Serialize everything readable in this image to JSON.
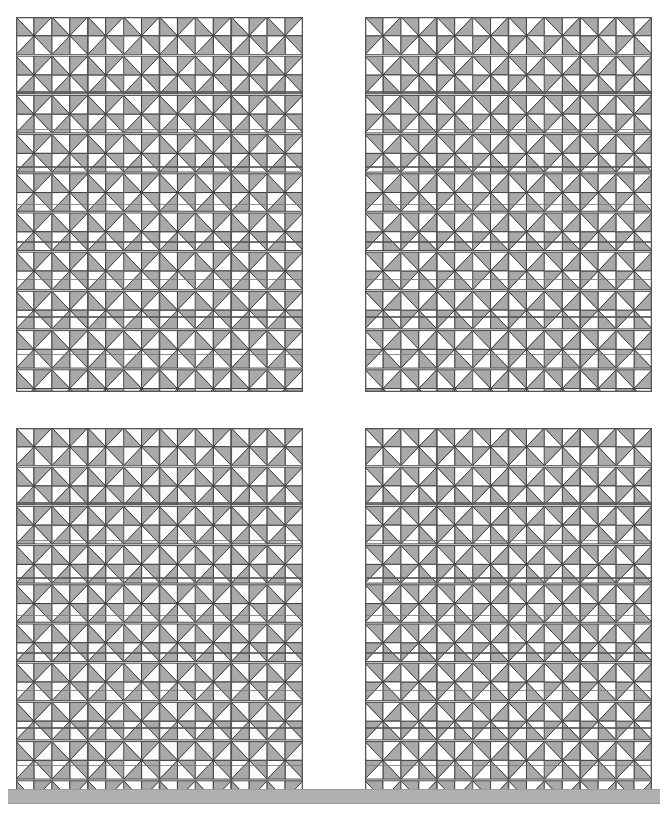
{
  "figure": {
    "title": "",
    "caption": "",
    "width": 668,
    "height": 816,
    "background": "#ffffff"
  },
  "palette": {
    "gray_fill": "#a9a9a9",
    "white_fill": "#ffffff",
    "light_fill": "#f4f4f4",
    "pale_fill": "#fbfbfb",
    "stroke": "#3a3a3a",
    "grid_major": "#555555",
    "grid_minor": "#777777",
    "bar_fill": "#b0b0b0",
    "bar_stroke": "#9a9a9a"
  },
  "geometry": {
    "cols_major": 4,
    "rows_major": 5,
    "subdivisions_per_major": 2,
    "cells_across": 8,
    "cells_down": 10,
    "triangles_per_cell": 8,
    "cell_size": 35.6,
    "stroke_width": 0.9,
    "grid_major_width": 1.6,
    "grid_minor_width": 0.8
  },
  "panels": [
    {
      "name": "panel-top-left",
      "label": "a",
      "x": 16,
      "y": 17,
      "width": 287,
      "height": 375,
      "cols": 8,
      "rows": 10,
      "vane_fill": "#ffffff",
      "corner_fill": "#a9a9a9",
      "phase": 0,
      "scheme": "vanes-white-corners-gray"
    },
    {
      "name": "panel-top-right",
      "label": "b",
      "x": 365,
      "y": 17,
      "width": 287,
      "height": 375,
      "cols": 8,
      "rows": 10,
      "vane_fill": "#a9a9a9",
      "corner_fill": "#ffffff",
      "phase": 0,
      "scheme": "vanes-gray-corners-white"
    },
    {
      "name": "panel-bottom-left",
      "label": "c",
      "x": 16,
      "y": 428,
      "width": 287,
      "height": 375,
      "cols": 8,
      "rows": 10,
      "vane_fill": "#fbfbfb",
      "corner_fill": "#a9a9a9",
      "phase": 1,
      "scheme": "vanes-pale-corners-gray-offset"
    },
    {
      "name": "panel-bottom-right",
      "label": "d",
      "x": 365,
      "y": 428,
      "width": 287,
      "height": 375,
      "cols": 8,
      "rows": 10,
      "vane_fill": "#a9a9a9",
      "corner_fill": "#ffffff",
      "phase": 0,
      "scheme": "vanes-gray-corners-white"
    }
  ],
  "bottom_bar": {
    "name": "bottom-rule-bar",
    "x": 8,
    "y": 789,
    "width": 652,
    "height": 13,
    "fill": "#b0b0b0"
  }
}
